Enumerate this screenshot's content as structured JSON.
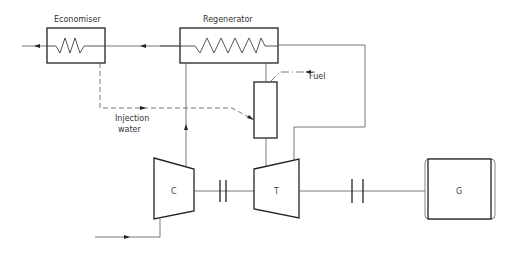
{
  "diagram": {
    "type": "gas-turbine-cycle-schematic",
    "labels": {
      "economiser": "Economiser",
      "regenerator": "Regenerator",
      "fuel": "Fuel",
      "injection_water_line1": "Injection",
      "injection_water_line2": "water",
      "compressor": "C",
      "turbine": "T",
      "generator": "G"
    },
    "components": [
      {
        "id": "economiser",
        "label": "Economiser",
        "kind": "heat-exchanger"
      },
      {
        "id": "regenerator",
        "label": "Regenerator",
        "kind": "heat-exchanger"
      },
      {
        "id": "combustor",
        "label": "",
        "kind": "combustion-chamber"
      },
      {
        "id": "compressor",
        "label": "C",
        "kind": "compressor"
      },
      {
        "id": "turbine",
        "label": "T",
        "kind": "turbine"
      },
      {
        "id": "generator",
        "label": "G",
        "kind": "generator"
      }
    ],
    "connections": [
      {
        "from": "inlet",
        "to": "compressor",
        "style": "solid"
      },
      {
        "from": "compressor",
        "to": "regenerator",
        "style": "solid"
      },
      {
        "from": "regenerator",
        "to": "combustor",
        "style": "solid"
      },
      {
        "from": "fuel",
        "to": "combustor",
        "style": "dash-dot"
      },
      {
        "from": "economiser",
        "to": "combustor",
        "style": "dashed",
        "label": "Injection water"
      },
      {
        "from": "combustor",
        "to": "turbine",
        "style": "solid"
      },
      {
        "from": "turbine",
        "to": "regenerator",
        "style": "solid"
      },
      {
        "from": "regenerator",
        "to": "economiser",
        "style": "solid"
      },
      {
        "from": "economiser",
        "to": "exhaust",
        "style": "solid"
      },
      {
        "from": "compressor",
        "to": "turbine",
        "style": "shaft-coupling"
      },
      {
        "from": "turbine",
        "to": "generator",
        "style": "shaft-coupling"
      }
    ]
  }
}
